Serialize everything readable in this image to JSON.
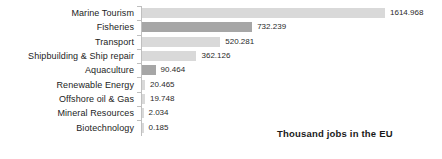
{
  "chart_data": {
    "type": "bar",
    "orientation": "horizontal",
    "title": "",
    "subtitle": "",
    "xlabel": "",
    "ylabel": "",
    "annotation": "Thousand jobs in the EU",
    "grid": false,
    "legend_position": "bottom-right",
    "axis_visible": true,
    "xlim": [
      0,
      1614.968
    ],
    "categories": [
      "Marine Tourism",
      "Fisheries",
      "Transport",
      "Shipbuilding & Ship repair",
      "Aquaculture",
      "Renewable Energy",
      "Offshore oil & Gas",
      "Mineral Resources",
      "Biotechnology"
    ],
    "values": [
      1614.968,
      732.239,
      520.281,
      362.126,
      90.464,
      20.465,
      19.748,
      2.034,
      0.185
    ],
    "value_labels": [
      "1614.968",
      "732.239",
      "520.281",
      "362.126",
      "90.464",
      "20.465",
      "19.748",
      "2.034",
      "0.185"
    ],
    "bar_colors": [
      "#d9d9d9",
      "#a6a6a6",
      "#d9d9d9",
      "#d9d9d9",
      "#a6a6a6",
      "#d9d9d9",
      "#d9d9d9",
      "#d9d9d9",
      "#d9d9d9"
    ],
    "colors": {
      "bar_light": "#d9d9d9",
      "bar_dark": "#a6a6a6",
      "axis": "#bfbfbf",
      "label_text": "#1c1c1c",
      "value_text": "#2a2a2a",
      "background": "#ffffff"
    }
  }
}
